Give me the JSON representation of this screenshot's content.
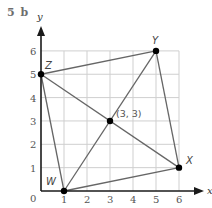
{
  "question_label": "5 b",
  "colors": {
    "grid": "#cfcfcf",
    "axis": "#1a1a1a",
    "segment": "#666666",
    "point": "#000000",
    "label": "#555555"
  },
  "axes": {
    "x_label": "x",
    "y_label": "y",
    "origin_label": "0",
    "x_ticks": [
      "1",
      "2",
      "3",
      "4",
      "5",
      "6"
    ],
    "y_ticks": [
      "1",
      "2",
      "3",
      "4",
      "5",
      "6"
    ]
  },
  "points": [
    {
      "name": "W",
      "x": 1,
      "y": 0
    },
    {
      "name": "X",
      "x": 6,
      "y": 1
    },
    {
      "name": "Y",
      "x": 5,
      "y": 6
    },
    {
      "name": "Z",
      "x": 0,
      "y": 5
    },
    {
      "name": "M",
      "x": 3,
      "y": 3,
      "label": "(3, 3)"
    }
  ],
  "segments": [
    [
      "W",
      "X"
    ],
    [
      "X",
      "Y"
    ],
    [
      "Y",
      "Z"
    ],
    [
      "Z",
      "W"
    ],
    [
      "W",
      "Y"
    ],
    [
      "Z",
      "X"
    ]
  ],
  "labels": {
    "W": "W",
    "X": "X",
    "Y": "Y",
    "Z": "Z",
    "midpoint": "(3, 3)"
  }
}
